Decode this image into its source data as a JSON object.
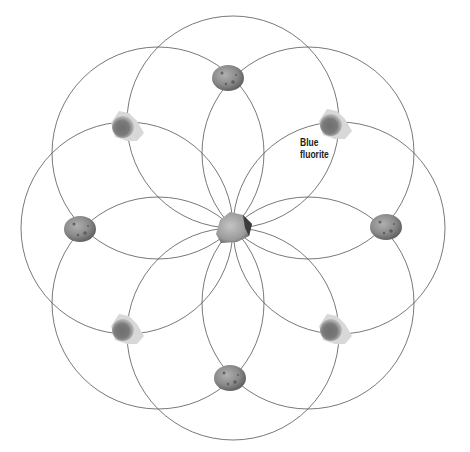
{
  "diagram": {
    "type": "crystal-grid",
    "pattern": "eight overlapping circles through a common center (seed-of-life style)",
    "center": {
      "x": 233,
      "y": 228
    },
    "circle_radius": 106,
    "circle_offset": 106,
    "line_color": "#555555",
    "background": "#ffffff"
  },
  "labels": [
    {
      "text_line1": "Blue",
      "text_line2": "fluorite",
      "x": 300,
      "y": 137
    }
  ],
  "stones": [
    {
      "name": "center-stone",
      "kind": "rough",
      "x": 233,
      "y": 228,
      "rx": 19,
      "ry": 16
    },
    {
      "name": "tumbled-top",
      "kind": "tumbled",
      "x": 228,
      "y": 78,
      "rx": 16,
      "ry": 13
    },
    {
      "name": "tumbled-right",
      "kind": "tumbled",
      "x": 386,
      "y": 227,
      "rx": 16,
      "ry": 13
    },
    {
      "name": "tumbled-bottom",
      "kind": "tumbled",
      "x": 230,
      "y": 378,
      "rx": 16,
      "ry": 13
    },
    {
      "name": "tumbled-left",
      "kind": "tumbled",
      "x": 80,
      "y": 229,
      "rx": 16,
      "ry": 13
    },
    {
      "name": "fluorite-top-left",
      "kind": "crystal",
      "x": 125,
      "y": 127,
      "rx": 17,
      "ry": 15
    },
    {
      "name": "fluorite-top-right",
      "kind": "crystal",
      "x": 333,
      "y": 125,
      "rx": 17,
      "ry": 15
    },
    {
      "name": "fluorite-bottom-left",
      "kind": "crystal",
      "x": 125,
      "y": 330,
      "rx": 17,
      "ry": 15
    },
    {
      "name": "fluorite-bottom-right",
      "kind": "crystal",
      "x": 333,
      "y": 330,
      "rx": 17,
      "ry": 15
    }
  ]
}
